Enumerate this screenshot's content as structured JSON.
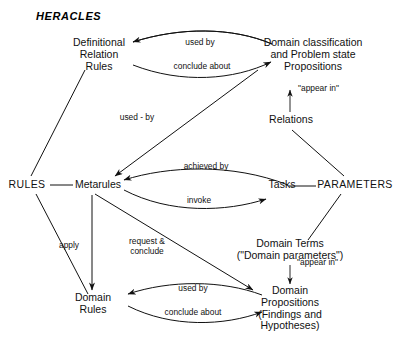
{
  "figure": {
    "title": "HERACLES",
    "type": "concept-diagram"
  },
  "nodes": {
    "definitional_relation_rules": {
      "lines": [
        "Definitional",
        "Relation",
        "Rules"
      ]
    },
    "domain_classification": {
      "lines": [
        "Domain classification",
        "and Problem state",
        "Propositions"
      ]
    },
    "relations": {
      "lines": [
        "Relations"
      ]
    },
    "rules": {
      "lines": [
        "RULES"
      ]
    },
    "metarules": {
      "lines": [
        "Metarules"
      ]
    },
    "tasks": {
      "lines": [
        "Tasks"
      ]
    },
    "parameters": {
      "lines": [
        "PARAMETERS"
      ]
    },
    "domain_terms": {
      "lines": [
        "Domain Terms",
        "(\"Domain parameters\")"
      ]
    },
    "domain_rules": {
      "lines": [
        "Domain",
        "Rules"
      ]
    },
    "domain_propositions": {
      "lines": [
        "Domain",
        "Propositions",
        "(Findings and",
        "Hypotheses)"
      ]
    }
  },
  "edge_labels": {
    "used_by_top": "used by",
    "conclude_about_top": "conclude about",
    "used_by_diag": "used - by",
    "appear_in_relations": "\"appear in\"",
    "achieved_by": "achieved  by",
    "invoke": "invoke",
    "apply": "apply",
    "request_conclude": [
      "request &",
      "conclude"
    ],
    "appear_in_terms": "\"appear in\"",
    "used_by_bottom": "used  by",
    "conclude_about_bottom": "conclude  about"
  },
  "edges": [
    {
      "from": "domain_classification",
      "to": "definitional_relation_rules",
      "label": "used by",
      "arrow": "left"
    },
    {
      "from": "definitional_relation_rules",
      "to": "domain_classification",
      "label": "conclude about",
      "arrow": "right"
    },
    {
      "from": "domain_classification",
      "to": "metarules",
      "label": "used - by",
      "arrow": "to"
    },
    {
      "from": "relations",
      "to": "domain_classification",
      "label": "\"appear in\"",
      "arrow": "up"
    },
    {
      "from": "tasks",
      "to": "metarules",
      "label": "achieved  by",
      "arrow": "left"
    },
    {
      "from": "metarules",
      "to": "tasks",
      "label": "invoke",
      "arrow": "right"
    },
    {
      "from": "definitional_relation_rules",
      "to": "rules",
      "label": "",
      "arrow": "none"
    },
    {
      "from": "rules",
      "to": "metarules",
      "label": "",
      "arrow": "none"
    },
    {
      "from": "rules",
      "to": "domain_rules",
      "label": "",
      "arrow": "none"
    },
    {
      "from": "metarules",
      "to": "domain_rules",
      "label": "apply",
      "arrow": "down"
    },
    {
      "from": "metarules",
      "to": "domain_propositions",
      "label": "request & conclude",
      "arrow": "to"
    },
    {
      "from": "relations",
      "to": "parameters",
      "label": "",
      "arrow": "none"
    },
    {
      "from": "tasks",
      "to": "parameters",
      "label": "",
      "arrow": "none"
    },
    {
      "from": "parameters",
      "to": "domain_terms",
      "label": "",
      "arrow": "none"
    },
    {
      "from": "domain_terms",
      "to": "domain_propositions",
      "label": "\"appear in\"",
      "arrow": "down"
    },
    {
      "from": "domain_propositions",
      "to": "domain_rules",
      "label": "used  by",
      "arrow": "left"
    },
    {
      "from": "domain_rules",
      "to": "domain_propositions",
      "label": "conclude  about",
      "arrow": "right"
    }
  ],
  "colors": {
    "ink": "#111111",
    "background": "#ffffff"
  }
}
